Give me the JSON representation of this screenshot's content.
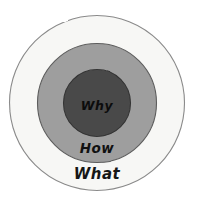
{
  "diagram": {
    "type": "concentric-circles",
    "background_color": "#ffffff",
    "rings": [
      {
        "id": "outer",
        "label": "What",
        "fill_color": "#f7f7f5",
        "stroke_color": "#8a8a8a",
        "text_color": "#161616",
        "center_x": 97,
        "center_y": 103,
        "radius": 88,
        "label_x": 97,
        "label_y": 178,
        "label_size": 15
      },
      {
        "id": "middle",
        "label": "How",
        "fill_color": "#9e9e9e",
        "stroke_color": "#5d5d5d",
        "text_color": "#111111",
        "center_x": 97,
        "center_y": 103,
        "radius": 60,
        "label_x": 97,
        "label_y": 153,
        "label_size": 13
      },
      {
        "id": "inner",
        "label": "Why",
        "fill_color": "#4a4a4a",
        "stroke_color": "#343434",
        "text_color": "#0c0c0c",
        "center_x": 97,
        "center_y": 103,
        "radius": 34,
        "label_x": 97,
        "label_y": 110,
        "label_size": 12
      }
    ]
  }
}
